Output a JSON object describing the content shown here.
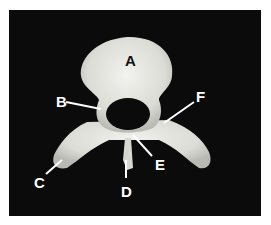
{
  "figure": {
    "background": "#0b0b0b",
    "bone_color": "#e8e8e4",
    "labels": [
      {
        "id": "A",
        "text": "A"
      },
      {
        "id": "B",
        "text": "B"
      },
      {
        "id": "C",
        "text": "C"
      },
      {
        "id": "D",
        "text": "D"
      },
      {
        "id": "E",
        "text": "E"
      },
      {
        "id": "F",
        "text": "F"
      }
    ]
  }
}
